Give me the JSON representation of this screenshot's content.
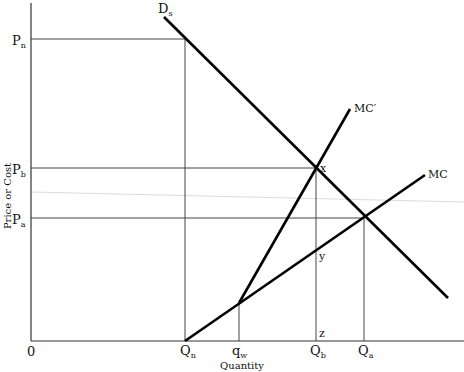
{
  "diagram": {
    "type": "economics-supply-demand",
    "x_axis_title": "Quantity",
    "y_axis_title": "Price or Cost",
    "origin_label": "0",
    "colors": {
      "curve": "#000000",
      "guide": "#333333",
      "artifact": "#d8d8d8",
      "text": "#111111"
    },
    "price_labels": [
      {
        "id": "pn",
        "base": "P",
        "sub": "n"
      },
      {
        "id": "pb",
        "base": "P",
        "sub": "b"
      },
      {
        "id": "pa",
        "base": "P",
        "sub": "a"
      }
    ],
    "quantity_labels": [
      {
        "id": "qn",
        "base": "Q",
        "sub": "n"
      },
      {
        "id": "qw",
        "base": "q",
        "sub": "w"
      },
      {
        "id": "qb",
        "base": "Q",
        "sub": "b"
      },
      {
        "id": "qa",
        "base": "Q",
        "sub": "a"
      }
    ],
    "curves": [
      {
        "id": "demand",
        "base": "D",
        "sub": "s"
      },
      {
        "id": "mc_prime",
        "base": "MC",
        "sub": "′"
      },
      {
        "id": "mc",
        "base": "MC",
        "sub": ""
      }
    ],
    "points": [
      {
        "id": "x",
        "label": "x"
      },
      {
        "id": "y",
        "label": "y"
      },
      {
        "id": "z",
        "label": "z"
      }
    ]
  }
}
